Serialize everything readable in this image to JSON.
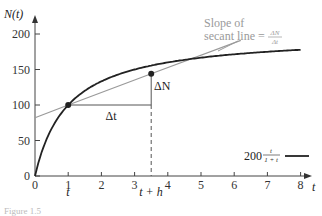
{
  "chart_data": {
    "type": "line",
    "title": "",
    "xlabel": "t",
    "ylabel": "N(t)",
    "xlim": [
      0,
      8.4
    ],
    "ylim": [
      0,
      210
    ],
    "x_ticks": [
      0,
      1,
      2,
      3,
      4,
      5,
      6,
      7,
      8
    ],
    "y_ticks": [
      0,
      50,
      100,
      150,
      200
    ],
    "grid": false,
    "series": [
      {
        "name": "200 t/(1+t)",
        "formula": "N(t) = 200 * t / (1 + t)",
        "color": "#222222",
        "x": [
          0,
          0.25,
          0.5,
          1,
          1.5,
          2,
          3,
          3.5,
          4,
          5,
          6,
          7,
          8
        ],
        "values": [
          0,
          40,
          66.7,
          100,
          120,
          133.3,
          150,
          155.6,
          160,
          166.7,
          171.4,
          175,
          177.8
        ]
      },
      {
        "name": "Secant line",
        "color": "#9a9a9a",
        "x": [
          0,
          1,
          3.5,
          6.2
        ],
        "values": [
          82,
          100,
          144,
          191
        ]
      }
    ],
    "points": [
      {
        "label": "t",
        "x": 1,
        "y": 100
      },
      {
        "label": "t + h",
        "x": 3.5,
        "y": 144
      }
    ],
    "annotations": {
      "secant_label_line1": "Slope of",
      "secant_label_line2": "secant line =",
      "secant_frac_num": "ΔN",
      "secant_frac_den": "Δt",
      "delta_t": "Δt",
      "delta_N": "ΔN",
      "t_marker": "t",
      "t_plus_h_marker": "t + h"
    },
    "legend": {
      "coefficient": "200",
      "frac_num": "t",
      "frac_den": "1 + t",
      "position": "lower right"
    },
    "caption": "Figure 1.5"
  },
  "axis": {
    "x_tick_labels": [
      "0",
      "1",
      "2",
      "3",
      "4",
      "5",
      "6",
      "7",
      "8"
    ],
    "y_tick_labels": [
      "0",
      "50",
      "100",
      "150",
      "200"
    ],
    "x_title": "t",
    "y_title": "N(t)"
  }
}
